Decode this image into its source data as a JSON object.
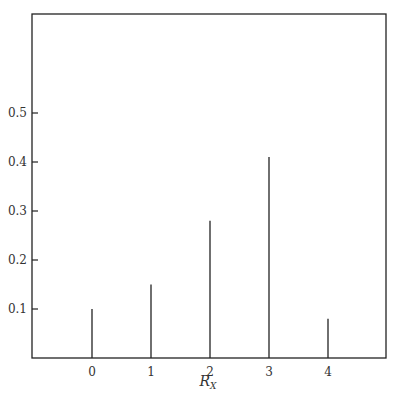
{
  "chart_data": {
    "type": "bar",
    "style": "stem",
    "title": "",
    "xlabel": "R",
    "xlabel_subscript": "X",
    "ylabel": "",
    "categories": [
      "0",
      "1",
      "2",
      "3",
      "4"
    ],
    "x": [
      0,
      1,
      2,
      3,
      4
    ],
    "values": [
      0.1,
      0.15,
      0.28,
      0.41,
      0.08
    ],
    "yticks": [
      "0.1",
      "0.2",
      "0.3",
      "0.4",
      "0.5"
    ],
    "ytick_values": [
      0.1,
      0.2,
      0.3,
      0.4,
      0.5
    ],
    "ylim": [
      0,
      0.6
    ],
    "xlim": [
      -1,
      5
    ],
    "grid": false,
    "legend": null
  },
  "colors": {
    "frame": "#222222",
    "stem": "#222222",
    "background": "#ffffff"
  }
}
